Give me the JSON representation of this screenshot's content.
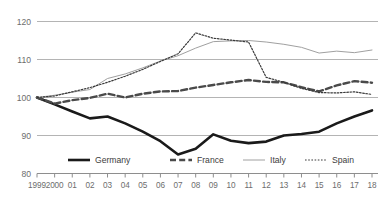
{
  "chart_data": {
    "type": "line",
    "title": "",
    "subtitle": "",
    "xlabel": "",
    "ylabel": "",
    "grid": "horizontal",
    "legend_position": "bottom-inside",
    "xlim": [
      0,
      19
    ],
    "ylim": [
      80,
      120
    ],
    "yticks": [
      80,
      90,
      100,
      110,
      120
    ],
    "categories": [
      "1999",
      "2000",
      "01",
      "02",
      "03",
      "04",
      "05",
      "06",
      "07",
      "08",
      "09",
      "10",
      "11",
      "12",
      "13",
      "14",
      "15",
      "16",
      "17",
      "18"
    ],
    "series": [
      {
        "name": "Germany",
        "color": "#1a1a1a",
        "style": "solid",
        "width": 2.6,
        "values": [
          100.0,
          98.2,
          96.3,
          94.5,
          95.0,
          93.2,
          91.0,
          88.5,
          85.0,
          86.5,
          90.3,
          88.6,
          88.0,
          88.4,
          90.0,
          90.4,
          91.0,
          93.2,
          95.0,
          96.6
        ]
      },
      {
        "name": "France",
        "color": "#4a4a4a",
        "style": "dashed",
        "width": 2.4,
        "values": [
          100.0,
          98.4,
          99.3,
          99.9,
          101.0,
          100.0,
          101.0,
          101.6,
          101.7,
          102.6,
          103.3,
          104.0,
          104.6,
          104.1,
          104.0,
          102.7,
          101.6,
          103.2,
          104.3,
          103.9
        ]
      },
      {
        "name": "Italy",
        "color": "#a0a0a0",
        "style": "solid",
        "width": 1.0,
        "values": [
          100.0,
          100.6,
          101.4,
          102.1,
          105.0,
          106.2,
          107.8,
          109.6,
          111.0,
          113.0,
          114.7,
          114.9,
          115.0,
          114.6,
          114.0,
          113.2,
          111.7,
          112.2,
          111.8,
          112.5
        ]
      },
      {
        "name": "Spain",
        "color": "#3a3a3a",
        "style": "dotted",
        "width": 1.2,
        "values": [
          100.0,
          100.4,
          101.5,
          102.6,
          104.0,
          105.6,
          107.4,
          109.5,
          111.5,
          117.0,
          115.6,
          115.1,
          114.6,
          105.3,
          104.0,
          102.4,
          101.3,
          101.2,
          101.5,
          100.8
        ]
      }
    ]
  },
  "axes": {
    "ytick_labels": [
      "120",
      "110",
      "100",
      "90",
      "80"
    ],
    "xtick_labels": [
      "1999",
      "2000",
      "01",
      "02",
      "03",
      "04",
      "05",
      "06",
      "07",
      "08",
      "09",
      "10",
      "11",
      "12",
      "13",
      "14",
      "15",
      "16",
      "17",
      "18"
    ]
  },
  "legend": {
    "entries": [
      {
        "label": "Germany",
        "swatch": "thick-solid-line",
        "color": "#1a1a1a"
      },
      {
        "label": "France",
        "swatch": "thick-dashed-line",
        "color": "#4a4a4a"
      },
      {
        "label": "Italy",
        "swatch": "thin-solid-line",
        "color": "#a0a0a0"
      },
      {
        "label": "Spain",
        "swatch": "thin-dotted-line",
        "color": "#3a3a3a"
      }
    ]
  },
  "colors": {
    "gridline": "#b4b4b4",
    "axis_text": "#6d6d6d",
    "background": "#ffffff"
  }
}
